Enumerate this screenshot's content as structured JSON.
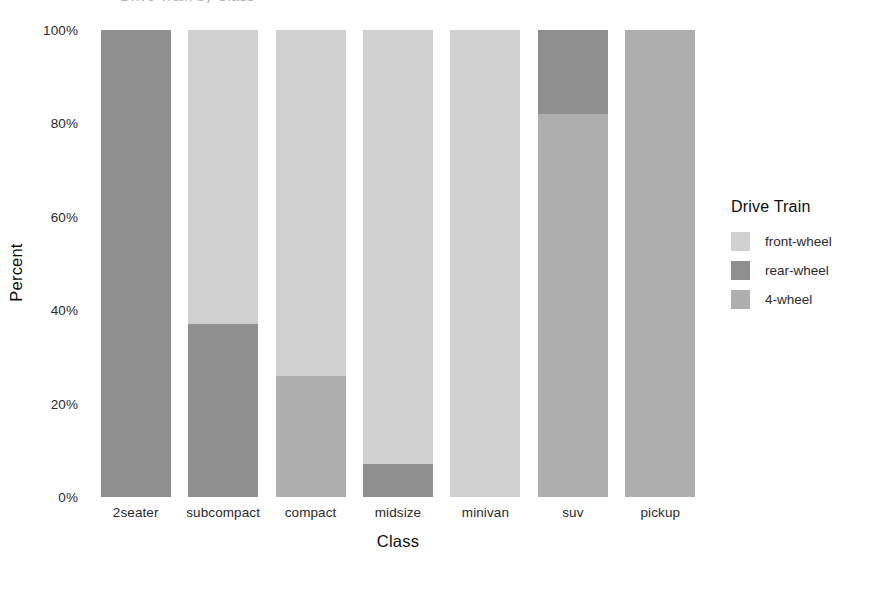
{
  "chart_data": {
    "type": "bar",
    "subtype": "stacked-percent",
    "title": "Drive Train by Class",
    "xlabel": "Class",
    "ylabel": "Percent",
    "ylim": [
      0,
      100
    ],
    "ytick_labels": [
      "0%",
      "20%",
      "40%",
      "60%",
      "80%",
      "100%"
    ],
    "ytick_values": [
      0,
      20,
      40,
      60,
      80,
      100
    ],
    "grid": false,
    "legend_position": "right",
    "legend_title": "Drive Train",
    "categories": [
      "2seater",
      "subcompact",
      "compact",
      "midsize",
      "minivan",
      "suv",
      "pickup"
    ],
    "series": [
      {
        "name": "front-wheel",
        "color": "#d0d0d0",
        "values": [
          0,
          63,
          74,
          93,
          100,
          0,
          0
        ]
      },
      {
        "name": "rear-wheel",
        "color": "#8f8f8f",
        "values": [
          100,
          37,
          0,
          7,
          0,
          18,
          0
        ]
      },
      {
        "name": "4-wheel",
        "color": "#aeaeae",
        "values": [
          0,
          0,
          26,
          0,
          0,
          82,
          100
        ]
      }
    ],
    "stack_order_top_to_bottom": [
      "front-wheel",
      "rear-wheel",
      "4-wheel"
    ]
  },
  "axes": {
    "y": {
      "title": "Percent",
      "ticks": [
        {
          "label": "100%",
          "value": 100
        },
        {
          "label": "80%",
          "value": 80
        },
        {
          "label": "60%",
          "value": 60
        },
        {
          "label": "40%",
          "value": 40
        },
        {
          "label": "20%",
          "value": 20
        },
        {
          "label": "0%",
          "value": 0
        }
      ]
    },
    "x": {
      "title": "Class",
      "ticks": [
        {
          "label": "2seater"
        },
        {
          "label": "subcompact"
        },
        {
          "label": "compact"
        },
        {
          "label": "midsize"
        },
        {
          "label": "minivan"
        },
        {
          "label": "suv"
        },
        {
          "label": "pickup"
        }
      ]
    }
  },
  "legend": {
    "title": "Drive Train",
    "items": [
      {
        "label": "front-wheel",
        "color": "#d0d0d0"
      },
      {
        "label": "rear-wheel",
        "color": "#8f8f8f"
      },
      {
        "label": "4-wheel",
        "color": "#aeaeae"
      }
    ]
  },
  "colors": {
    "front_wheel": "#d0d0d0",
    "rear_wheel": "#8f8f8f",
    "four_wheel": "#aeaeae",
    "background": "#ffffff",
    "text": "#2b2b2b"
  }
}
